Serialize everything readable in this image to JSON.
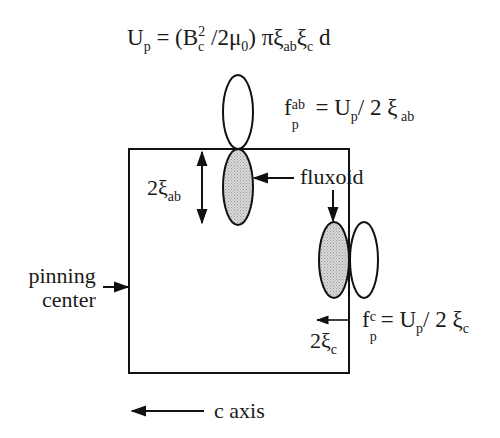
{
  "diagram": {
    "title_formula": {
      "lhs": "U",
      "lhs_sub": "p",
      "eq": " = (B",
      "bc_sub": "c",
      "bc_sup": "2",
      "mid": " /2μ",
      "mu_sub": "0",
      "rest": ") πξ",
      "xi1_sub": "ab",
      "xi2": "ξ",
      "xi2_sub": "c",
      "tail": " d"
    },
    "fab_formula": {
      "f": "f",
      "sup": "ab",
      "sub": "p",
      "eq": " =  U",
      "u_sub": "p",
      "rest": "/ 2 ξ",
      "xi_sub": " ab"
    },
    "fc_formula": {
      "f": "f",
      "sup": "c",
      "sub": "p",
      "eq": "= U",
      "u_sub": "p",
      "rest": "/ 2 ξ",
      "xi_sub": "c"
    },
    "labels": {
      "two_xi_ab": "2ξ",
      "two_xi_ab_sub": "ab",
      "fluxoid": "fluxoid",
      "pinning_line1": "pinning",
      "pinning_line2": "center",
      "two_xi_c": "2ξ",
      "two_xi_c_sub": "c",
      "c_axis": "c axis"
    },
    "colors": {
      "line": "#111111",
      "shaded_fill": "#cfcfcf",
      "background": "#ffffff"
    }
  }
}
